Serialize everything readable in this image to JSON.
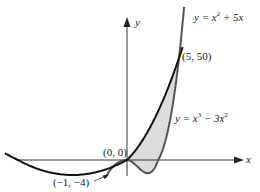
{
  "chart_data": {
    "type": "line",
    "title": "",
    "xlabel": "x",
    "ylabel": "y",
    "grid": false,
    "series": [
      {
        "name": "y = x^2 + 5x",
        "formula": "x^2 + 5x",
        "color": "#111111"
      },
      {
        "name": "y = x^3 - 3x^2",
        "formula": "x^3 - 3x^2",
        "color": "#555555"
      }
    ],
    "shaded_region": {
      "between": [
        "y = x^2 + 5x",
        "y = x^3 - 3x^2"
      ],
      "x_range": [
        0,
        5
      ],
      "fill": "#dcdcdc"
    },
    "annotations": [
      {
        "label": "(0, 0)",
        "x": 0,
        "y": 0
      },
      {
        "label": "(5, 50)",
        "x": 5,
        "y": 50
      },
      {
        "label": "(−1, −4)",
        "x": -1,
        "y": -4
      }
    ],
    "curve_labels": {
      "parabola": {
        "prefix": "y = x",
        "sup": "2",
        "suffix": " + 5x"
      },
      "cubic": {
        "prefix": "y = x",
        "sup1": "3",
        "mid": " − 3x",
        "sup2": "2"
      }
    }
  },
  "axes": {
    "x_label": "x",
    "y_label": "y"
  },
  "labels": {
    "origin": "(0, 0)",
    "upper_intersection": "(5, 50)",
    "lower_intersection": "(−1, −4)"
  }
}
